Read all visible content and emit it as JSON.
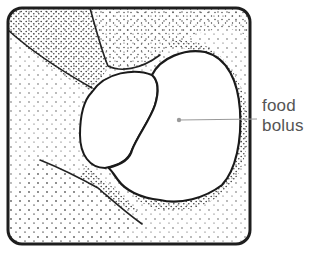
{
  "figure": {
    "type": "anatomical-illustration",
    "labels": [
      {
        "id": "food-bolus",
        "text_lines": [
          "food",
          "bolus"
        ]
      }
    ],
    "colors": {
      "outline": "#222222",
      "stipple": "#333333",
      "leader_line": "#999999",
      "label_text": "#555555",
      "background": "#ffffff"
    }
  }
}
